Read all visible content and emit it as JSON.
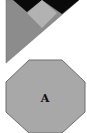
{
  "diagram": {
    "top_piece": {
      "description": "tangram-style composite triangle piece",
      "colors": {
        "triangle": "#8c8c8c",
        "black_wedge": "#0a0a0a",
        "diamond": "#b2b2b2"
      }
    },
    "octagon": {
      "label": "A",
      "fill": "#a8a8a8",
      "stroke": "#6e6e6e"
    }
  }
}
